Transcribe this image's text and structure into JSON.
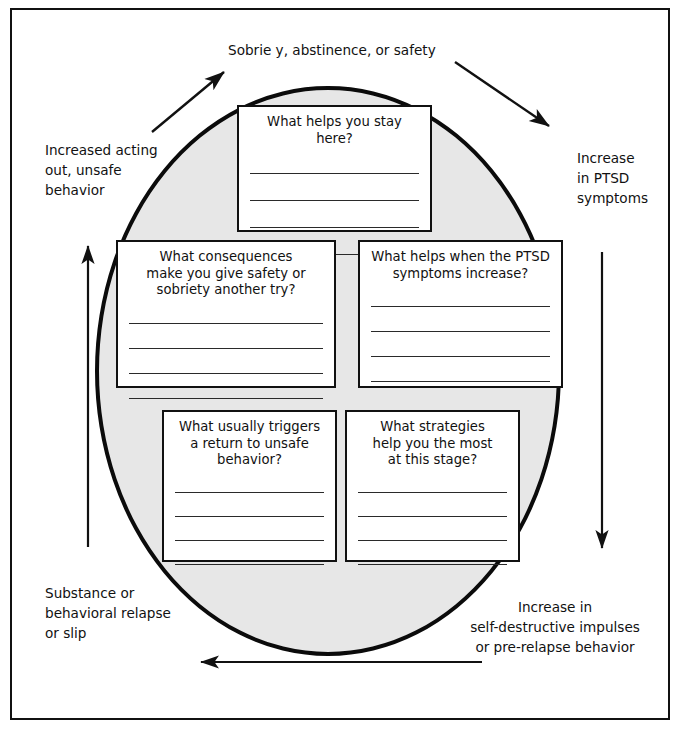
{
  "worksheet": {
    "stage_labels": {
      "top": "Sobrie y, abstinence, or safety",
      "left": "Increased acting\nout, unsafe\nbehavior",
      "right": "Increase\nin PTSD\nsymptoms",
      "bottom_left": "Substance or\nbehavioral relapse\nor slip",
      "bottom_right": "Increase in\nself-destructive impulses\nor pre-relapse behavior"
    },
    "prompt_boxes": [
      {
        "id": "box-top",
        "title": "What helps you stay here?",
        "line_count": 4
      },
      {
        "id": "box-midleft",
        "title": "What consequences\nmake you give safety or\nsobriety another try?",
        "line_count": 4
      },
      {
        "id": "box-midright",
        "title": "What helps when the PTSD\nsymptoms increase?",
        "line_count": 4
      },
      {
        "id": "box-botleft",
        "title": "What usually triggers\na return to unsafe\nbehavior?",
        "line_count": 4
      },
      {
        "id": "box-botright",
        "title": "What strategies\nhelp you the most\nat this stage?",
        "line_count": 4
      }
    ],
    "arrows": [
      {
        "name": "arrow-up-left-diagonal",
        "direction": "up-right"
      },
      {
        "name": "arrow-down-right-diagonal",
        "direction": "down-right"
      },
      {
        "name": "arrow-left-vertical",
        "direction": "up"
      },
      {
        "name": "arrow-right-vertical",
        "direction": "down"
      },
      {
        "name": "arrow-bottom-horizontal",
        "direction": "left"
      }
    ],
    "colors": {
      "ellipse_fill": "#e7e7e7",
      "ink": "#111111",
      "page": "#ffffff"
    }
  }
}
